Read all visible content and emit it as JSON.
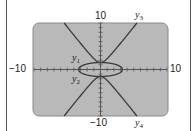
{
  "chart_data": {
    "type": "line",
    "title": "",
    "xlabel": "",
    "ylabel": "",
    "xlim": [
      -10,
      10
    ],
    "ylim": [
      -10,
      10
    ],
    "tick_spacing": 1,
    "grid": false,
    "tick_labels": {
      "x_min": "−10",
      "x_max": "10",
      "y_min": "−10",
      "y_max": "10"
    },
    "series": [
      {
        "name": "y1",
        "label": "y",
        "sub": "1",
        "description": "upper half of ellipse",
        "a": 3.3,
        "b": 1.5,
        "kind": "ellipse_upper"
      },
      {
        "name": "y2",
        "label": "y",
        "sub": "2",
        "description": "lower half of ellipse",
        "a": 3.3,
        "b": 1.5,
        "kind": "ellipse_lower"
      },
      {
        "name": "y3",
        "label": "y",
        "sub": "3",
        "description": "upper branch of hyperbola",
        "a": 1.5,
        "b": 0.83,
        "kind": "hyperbola_upper"
      },
      {
        "name": "y4",
        "label": "y",
        "sub": "4",
        "description": "lower branch of hyperbola",
        "a": 1.5,
        "b": 0.83,
        "kind": "hyperbola_lower"
      }
    ],
    "screen_color": "#b9b9b9",
    "curve_color": "#3a3a3a"
  }
}
